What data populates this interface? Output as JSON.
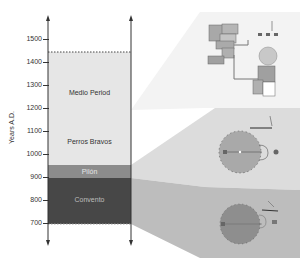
{
  "axis": {
    "label": "Years A.D.",
    "ticks": [
      {
        "label": "1500",
        "y": 39
      },
      {
        "label": "1400",
        "y": 62
      },
      {
        "label": "1300",
        "y": 85
      },
      {
        "label": "1200",
        "y": 108
      },
      {
        "label": "1100",
        "y": 131
      },
      {
        "label": "1000",
        "y": 154
      },
      {
        "label": "900",
        "y": 177
      },
      {
        "label": "800",
        "y": 200
      },
      {
        "label": "700",
        "y": 223
      }
    ]
  },
  "periods": [
    {
      "name": "Medio Period",
      "start": 1200,
      "end": 1450,
      "color": "#e6e6e6"
    },
    {
      "name": "Perros Bravos",
      "start": 950,
      "end": 1200,
      "color": "#e6e6e6"
    },
    {
      "name": "Pilón",
      "start": 900,
      "end": 950,
      "color": "#8c8c8c"
    },
    {
      "name": "Convento",
      "start": 700,
      "end": 900,
      "color": "#4a4a4a"
    }
  ],
  "labels": {
    "medio": "Medio Period",
    "perros": "Perros Bravos",
    "pilon": "Pilón",
    "convento": "Convento"
  },
  "panels": [
    {
      "name": "Medio Period settlement plan",
      "color": "#f2f2f2"
    },
    {
      "name": "Perros Bravos / Pilón pithouse plan",
      "color": "#d9d9d9"
    },
    {
      "name": "Convento pithouse plan",
      "color": "#bfbfbf"
    }
  ]
}
